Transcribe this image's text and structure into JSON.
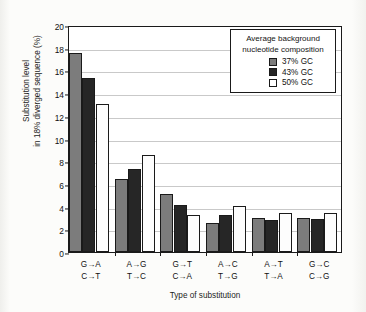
{
  "chart_data": {
    "type": "bar",
    "title": "",
    "xlabel": "Type of substitution",
    "ylabel": "Substitution level\nin 18% diverged sequence (%)",
    "ylim": [
      0,
      20
    ],
    "ytick_step": 2,
    "yticks": [
      "0",
      "2",
      "4",
      "6",
      "8",
      "10",
      "12",
      "14",
      "16",
      "18",
      "20"
    ],
    "grid": true,
    "legend_position": "top-right",
    "legend_title": "Average background\nnucleotide composition",
    "categories": [
      "G→A\nC→T",
      "A→G\nT→C",
      "G→T\nC→A",
      "A→C\nT→G",
      "A→T\nT→A",
      "G→C\nC→G"
    ],
    "series": [
      {
        "name": "37% GC",
        "color": "#7c7c7c",
        "values": [
          17.5,
          6.4,
          5.1,
          2.55,
          3.0,
          3.0
        ]
      },
      {
        "name": "43% GC",
        "color": "#262626",
        "values": [
          15.35,
          7.3,
          4.15,
          3.3,
          2.8,
          2.9
        ]
      },
      {
        "name": "50% GC",
        "color": "#ffffff",
        "values": [
          13.05,
          8.55,
          3.3,
          4.05,
          3.4,
          3.4
        ]
      }
    ]
  }
}
